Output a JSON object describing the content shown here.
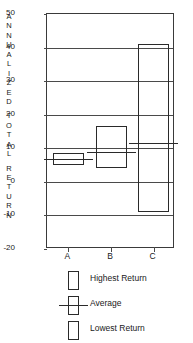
{
  "chart_data": {
    "type": "bar",
    "title": "",
    "subtitle": "",
    "xlabel": "",
    "ylabel": "ANNUALIZED TOTAL RETURN",
    "ylabel_letters": [
      "A",
      "N",
      "N",
      "U",
      "A",
      "L",
      "I",
      "Z",
      "E",
      "D",
      "",
      "T",
      "O",
      "T",
      "A",
      "L",
      "",
      "R",
      "E",
      "T",
      "U",
      "R",
      "N"
    ],
    "categories": [
      "A",
      "B",
      "C"
    ],
    "ylim": [
      -20,
      50
    ],
    "yticks": [
      50,
      40,
      30,
      20,
      10,
      0,
      -10,
      -20
    ],
    "ytick_labels": [
      "50",
      "40",
      "30",
      "20",
      "10",
      "0",
      "-10",
      "-20"
    ],
    "grid": true,
    "grid_axis": "y",
    "legend_position": "below",
    "series": [
      {
        "name": "Highest Return",
        "values": [
          8.5,
          16.5,
          41.0
        ]
      },
      {
        "name": "Average",
        "values": [
          6.7,
          9.0,
          11.5
        ]
      },
      {
        "name": "Lowest Return",
        "values": [
          5.0,
          4.0,
          -9.0
        ]
      }
    ],
    "boxes": [
      {
        "category": "A",
        "high": 8.5,
        "average": 6.7,
        "low": 5.0
      },
      {
        "category": "B",
        "high": 16.5,
        "average": 9.0,
        "low": 4.0
      },
      {
        "category": "C",
        "high": 41.0,
        "average": 11.5,
        "low": -9.0
      }
    ],
    "legend": [
      {
        "key": "highest",
        "label": "Highest Return"
      },
      {
        "key": "average",
        "label": "Average"
      },
      {
        "key": "lowest",
        "label": "Lowest Return"
      }
    ],
    "colors": {
      "line": "#2a2a2a",
      "grid": "#4a4a4a",
      "text": "#1a1a1a",
      "background": "#ffffff"
    }
  }
}
